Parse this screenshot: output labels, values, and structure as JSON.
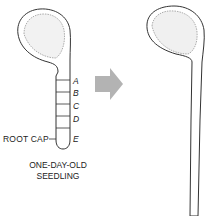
{
  "left_seedling": {
    "segment_labels": [
      "A",
      "B",
      "C",
      "D",
      "E"
    ],
    "root_cap_label": "ROOT CAP",
    "caption_line1": "ONE-DAY-OLD",
    "caption_line2": "SEEDLING"
  },
  "arrow": {
    "direction": "right",
    "color": "#b3b3b3"
  },
  "right_seedling": {
    "label": ""
  }
}
